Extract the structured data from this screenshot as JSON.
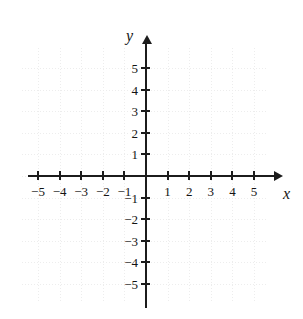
{
  "figure": {
    "kind": "cartesian-coordinate-plane",
    "background_color": "#ffffff",
    "axis_color": "#1c1c1c",
    "grid_color": "#ededed",
    "label_color": "#141414"
  },
  "chart_data": {
    "type": "scatter",
    "title": "",
    "subtitle": "",
    "xlabel": "x",
    "ylabel": "y",
    "xlim": [
      -6,
      6
    ],
    "ylim": [
      -6,
      6
    ],
    "xticks": [
      -5,
      -4,
      -3,
      -2,
      -1,
      1,
      2,
      3,
      4,
      5
    ],
    "yticks": [
      -5,
      -4,
      -3,
      -2,
      -1,
      1,
      2,
      3,
      4,
      5
    ],
    "xtick_labels": [
      "−5",
      "−4",
      "−3",
      "−2",
      "−1",
      "1",
      "2",
      "3",
      "4",
      "5"
    ],
    "ytick_labels": [
      "−5",
      "−4",
      "−3",
      "−2",
      "−1",
      "1",
      "2",
      "3",
      "4",
      "5"
    ],
    "grid": true,
    "grid_style": "dotted",
    "grid_step": 1,
    "origin_labeled": false,
    "legend": null,
    "series": [],
    "annotations": [],
    "axis_arrows": {
      "x_positive": true,
      "y_positive": true
    }
  },
  "axis_names": {
    "x": "x",
    "y": "y"
  },
  "x_axis": {
    "name": "x-axis",
    "ticks": [
      {
        "value": -5,
        "label": "−5"
      },
      {
        "value": -4,
        "label": "−4"
      },
      {
        "value": -3,
        "label": "−3"
      },
      {
        "value": -2,
        "label": "−2"
      },
      {
        "value": -1,
        "label": "−1"
      },
      {
        "value": 1,
        "label": "1"
      },
      {
        "value": 2,
        "label": "2"
      },
      {
        "value": 3,
        "label": "3"
      },
      {
        "value": 4,
        "label": "4"
      },
      {
        "value": 5,
        "label": "5"
      }
    ]
  },
  "y_axis": {
    "name": "y-axis",
    "ticks": [
      {
        "value": 5,
        "label": "5"
      },
      {
        "value": 4,
        "label": "4"
      },
      {
        "value": 3,
        "label": "3"
      },
      {
        "value": 2,
        "label": "2"
      },
      {
        "value": 1,
        "label": "1"
      },
      {
        "value": -1,
        "label": "−1"
      },
      {
        "value": -2,
        "label": "−2"
      },
      {
        "value": -3,
        "label": "−3"
      },
      {
        "value": -4,
        "label": "−4"
      },
      {
        "value": -5,
        "label": "−5"
      }
    ]
  }
}
